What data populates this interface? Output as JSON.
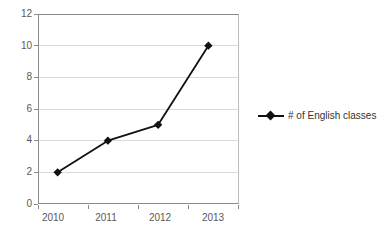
{
  "chart_data": {
    "type": "line",
    "title": "",
    "xlabel": "",
    "ylabel": "",
    "categories": [
      "2010",
      "2011",
      "2012",
      "2013"
    ],
    "series": [
      {
        "name": "# of English classes",
        "values": [
          2,
          4,
          5,
          10
        ],
        "color": "#111111",
        "marker": "diamond"
      }
    ],
    "ylim": [
      0,
      12
    ],
    "yticks": [
      0,
      2,
      4,
      6,
      8,
      10,
      12
    ],
    "ytick_labels": [
      "0",
      "2",
      "4",
      "6",
      "8",
      "10",
      "12"
    ],
    "grid": true,
    "grid_axis": "y",
    "legend": {
      "position": "right",
      "entries": [
        "# of English classes"
      ]
    },
    "axis_color": "#8a8a8a",
    "grid_color": "#d9d9d9",
    "background": "#ffffff",
    "tick_label_color": "#595959"
  }
}
